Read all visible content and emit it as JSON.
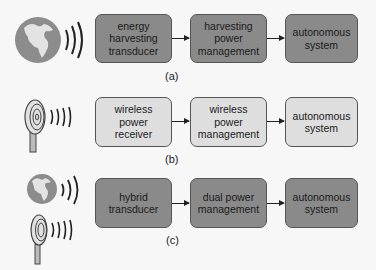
{
  "rows": [
    {
      "id": "a",
      "label": "(a)",
      "source": [
        "globe"
      ],
      "boxes": [
        "energy\nharvesting\ntransducer",
        "harvesting\npower\nmanagement",
        "autonomous\nsystem"
      ],
      "fill": "#8a8a8a"
    },
    {
      "id": "b",
      "label": "(b)",
      "source": [
        "antenna"
      ],
      "boxes": [
        "wireless\npower\nreceiver",
        "wireless\npower\nmanagement",
        "autonomous\nsystem"
      ],
      "fill": "#dedede"
    },
    {
      "id": "c",
      "label": "(c)",
      "source": [
        "globe",
        "antenna"
      ],
      "boxes": [
        "hybrid\ntransducer",
        "dual power\nmanagement",
        "autonomous\nsystem"
      ],
      "fill": "#8a8a8a"
    }
  ]
}
